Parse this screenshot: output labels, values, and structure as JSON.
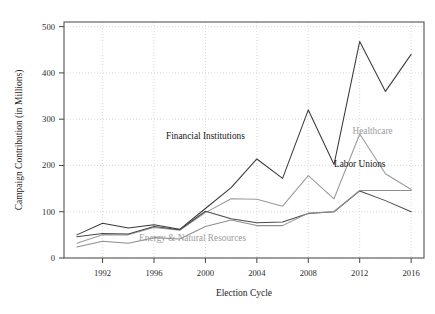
{
  "chart_data": {
    "type": "line",
    "title": "",
    "xlabel": "Election Cycle",
    "ylabel": "Campaign Contribution (in Millions)",
    "x": [
      1990,
      1992,
      1994,
      1996,
      1998,
      2000,
      2002,
      2004,
      2006,
      2008,
      2010,
      2012,
      2014,
      2016
    ],
    "xlim": [
      1989,
      2017
    ],
    "ylim": [
      0,
      510
    ],
    "xticks": [
      1992,
      1996,
      2000,
      2004,
      2008,
      2012,
      2016
    ],
    "xtick_labels": [
      "1992",
      "1996",
      "2000",
      "2004",
      "2008",
      "2012",
      "2016"
    ],
    "yticks": [
      0,
      100,
      200,
      300,
      400,
      500
    ],
    "ytick_labels": [
      "0",
      "100",
      "200",
      "300",
      "400",
      "500"
    ],
    "grid": true,
    "legend_position": "inline-annotations",
    "series": [
      {
        "name": "Financial Institutions",
        "color": "#3a3a3a",
        "label_x": 2000,
        "label_y": 258,
        "label_anchor": "middle",
        "label_style": "dark",
        "values": [
          50,
          75,
          65,
          72,
          62,
          107,
          152,
          214,
          172,
          320,
          202,
          468,
          360,
          440
        ]
      },
      {
        "name": "Healthcare",
        "color": "#9a9a9a",
        "label_x": 2013,
        "label_y": 268,
        "label_anchor": "middle",
        "label_style": "light",
        "values": [
          32,
          50,
          50,
          66,
          60,
          98,
          128,
          127,
          112,
          178,
          128,
          268,
          182,
          148
        ]
      },
      {
        "name": "Labor Unions",
        "color": "#4a4a4a",
        "label_x": 2012,
        "label_y": 196,
        "label_anchor": "middle",
        "label_style": "dark",
        "values": [
          46,
          53,
          52,
          68,
          61,
          101,
          85,
          76,
          78,
          96,
          100,
          145,
          124,
          100
        ]
      },
      {
        "name": "Energy & Natural Resources",
        "color": "#8e8e8e",
        "label_x": 1999,
        "label_y": 36,
        "label_anchor": "middle",
        "label_style": "light",
        "values": [
          24,
          36,
          32,
          44,
          41,
          68,
          82,
          70,
          70,
          97,
          100,
          146,
          146,
          146
        ]
      }
    ]
  }
}
